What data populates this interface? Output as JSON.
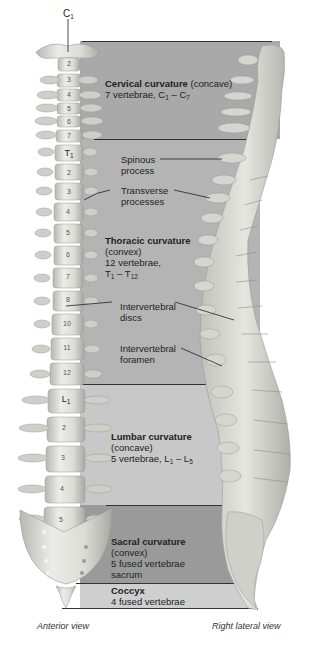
{
  "colors": {
    "cervical_band": "#a9a9a9",
    "thoracic_band": "#b4b4b4",
    "lumbar_band": "#c8c8c8",
    "sacral_band": "#9a9a9a",
    "coccyx_band": "#cfcfcf",
    "bone": "#d9d9d4",
    "bone_shadow": "#a8a8a4",
    "divider": "#3a3a3a"
  },
  "top_label": {
    "letter": "C",
    "sub": "1"
  },
  "regions": [
    {
      "id": "cervical",
      "title": "Cervical curvature",
      "qualifier": "(concave)",
      "line2": "7 vertebrae, ",
      "range": {
        "a": "C",
        "a_sub": "1",
        "dash": " – ",
        "b": "C",
        "b_sub": "7"
      }
    },
    {
      "id": "thoracic",
      "title": "Thoracic curvature",
      "qualifier": "(convex)",
      "line2": "12 vertebrae,",
      "range": {
        "a": "T",
        "a_sub": "1",
        "dash": " – ",
        "b": "T",
        "b_sub": "12"
      }
    },
    {
      "id": "lumbar",
      "title": "Lumbar curvature",
      "qualifier": "(concave)",
      "line2": "5 vertebrae, ",
      "range": {
        "a": "L",
        "a_sub": "1",
        "dash": " – ",
        "b": "L",
        "b_sub": "5"
      }
    },
    {
      "id": "sacral",
      "title": "Sacral curvature",
      "qualifier": "(convex)",
      "line2": "5 fused vertebrae",
      "line3": "sacrum"
    },
    {
      "id": "coccyx",
      "title": "Coccyx",
      "line2": "4 fused vertebrae"
    }
  ],
  "callouts": [
    {
      "id": "spinous",
      "line1": "Spinous",
      "line2": "process"
    },
    {
      "id": "transverse",
      "line1": "Transverse",
      "line2": "processes"
    },
    {
      "id": "discs",
      "line1": "Intervertebral",
      "line2": "discs"
    },
    {
      "id": "foramen",
      "line1": "Intervertebral",
      "line2": "foramen"
    }
  ],
  "vertebrae": {
    "cervical": [
      "2",
      "3",
      "4",
      "5",
      "6",
      "7"
    ],
    "thoracic_first": {
      "letter": "T",
      "sub": "1"
    },
    "thoracic": [
      "2",
      "3",
      "4",
      "5",
      "6",
      "7",
      "8",
      "9",
      "10",
      "11",
      "12"
    ],
    "lumbar_first": {
      "letter": "L",
      "sub": "1"
    },
    "lumbar": [
      "2",
      "3",
      "4",
      "5"
    ]
  },
  "captions": {
    "anterior": "Anterior view",
    "lateral": "Right lateral view"
  }
}
